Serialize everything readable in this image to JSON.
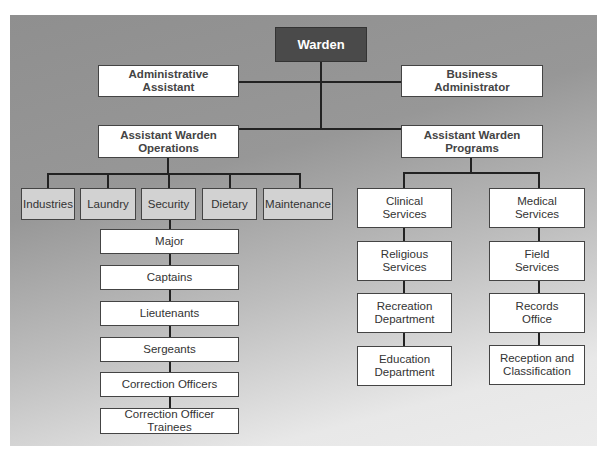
{
  "chart": {
    "top": {
      "label": "Warden"
    },
    "staff": [
      {
        "label": "Administrative\nAssistant"
      },
      {
        "label": "Business\nAdministrator"
      }
    ],
    "assistant_wardens": [
      {
        "label": "Assistant Warden\nOperations"
      },
      {
        "label": "Assistant Warden\nPrograms"
      }
    ],
    "operations_departments": [
      {
        "label": "Industries"
      },
      {
        "label": "Laundry"
      },
      {
        "label": "Security"
      },
      {
        "label": "Dietary"
      },
      {
        "label": "Maintenance"
      }
    ],
    "security_chain": [
      {
        "label": "Major"
      },
      {
        "label": "Captains"
      },
      {
        "label": "Lieutenants"
      },
      {
        "label": "Sergeants"
      },
      {
        "label": "Correction Officers"
      },
      {
        "label": "Correction Officer Trainees"
      }
    ],
    "programs_left": [
      {
        "label": "Clinical\nServices"
      },
      {
        "label": "Religious\nServices"
      },
      {
        "label": "Recreation\nDepartment"
      },
      {
        "label": "Education\nDepartment"
      }
    ],
    "programs_right": [
      {
        "label": "Medical\nServices"
      },
      {
        "label": "Field\nServices"
      },
      {
        "label": "Records\nOffice"
      },
      {
        "label": "Reception and\nClassification"
      }
    ]
  },
  "colors": {
    "warden_fill": "#4a4a4a",
    "department_fill": "#d2d2d2",
    "box_fill": "#ffffff",
    "connector": "#222222"
  }
}
